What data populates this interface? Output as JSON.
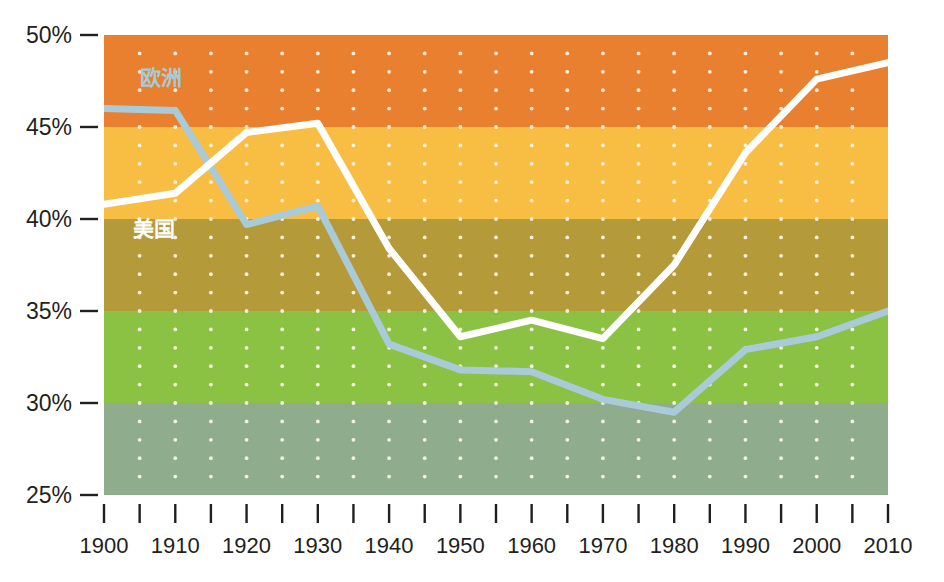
{
  "chart_data": {
    "type": "line",
    "title": "",
    "subtitle": "",
    "xlabel": "",
    "ylabel": "",
    "xlim": [
      1900,
      2010
    ],
    "ylim": [
      25,
      50
    ],
    "x_ticks": [
      1900,
      1910,
      1920,
      1930,
      1940,
      1950,
      1960,
      1970,
      1980,
      1990,
      2000,
      2010
    ],
    "x_minor_ticks": [
      1900,
      1905,
      1910,
      1915,
      1920,
      1925,
      1930,
      1935,
      1940,
      1945,
      1950,
      1955,
      1960,
      1965,
      1970,
      1975,
      1980,
      1985,
      1990,
      1995,
      2000,
      2005,
      2010
    ],
    "y_ticks": [
      25,
      30,
      35,
      40,
      45,
      50
    ],
    "y_tick_labels": [
      "25%",
      "30%",
      "35%",
      "40%",
      "45%",
      "50%"
    ],
    "grid": "dotted-white-dots",
    "legend": "inline-labels",
    "series": [
      {
        "name": "欧洲",
        "color": "#a9cad8",
        "label_color": "#a9cad8",
        "x": [
          1900,
          1910,
          1920,
          1930,
          1940,
          1950,
          1960,
          1970,
          1980,
          1990,
          2000,
          2010
        ],
        "values": [
          46.0,
          45.9,
          39.7,
          40.7,
          33.2,
          31.8,
          31.7,
          30.2,
          29.5,
          32.9,
          33.6,
          35.0
        ]
      },
      {
        "name": "美国",
        "color": "#ffffff",
        "label_color": "#ffffff",
        "x": [
          1900,
          1910,
          1920,
          1930,
          1940,
          1950,
          1960,
          1970,
          1980,
          1990,
          2000,
          2010
        ],
        "values": [
          40.8,
          41.4,
          44.7,
          45.2,
          38.4,
          33.6,
          34.5,
          33.5,
          37.5,
          43.6,
          47.6,
          48.5
        ]
      }
    ],
    "bands": [
      {
        "name": "band-orange",
        "from": 45,
        "to": 50,
        "color": "#e8802f"
      },
      {
        "name": "band-amber",
        "from": 40,
        "to": 45,
        "color": "#f8bd43"
      },
      {
        "name": "band-olive",
        "from": 35,
        "to": 40,
        "color": "#b49a38"
      },
      {
        "name": "band-green",
        "from": 30,
        "to": 35,
        "color": "#8cc243"
      },
      {
        "name": "band-sage",
        "from": 25,
        "to": 30,
        "color": "#8fad8c"
      }
    ],
    "annotations": [
      {
        "name": "europe-label",
        "text": "欧洲",
        "x": 1905,
        "y": 47.3,
        "color": "#a9cad8"
      },
      {
        "name": "usa-label",
        "text": "美国",
        "x": 1904,
        "y": 39.1,
        "color": "#ffffff"
      }
    ]
  },
  "axes": {
    "y_labels": [
      "50%",
      "45%",
      "40%",
      "35%",
      "30%",
      "25%"
    ],
    "x_labels": [
      "1900",
      "1910",
      "1920",
      "1930",
      "1940",
      "1950",
      "1960",
      "1970",
      "1980",
      "1990",
      "2000",
      "2010"
    ]
  },
  "colors": {
    "band_orange": "#e8802f",
    "band_amber": "#f8bd43",
    "band_olive": "#b49a38",
    "band_green": "#8cc243",
    "band_sage": "#8fad8c",
    "europe_line": "#a9cad8",
    "usa_line": "#ffffff",
    "text": "#231f20",
    "grid_dot": "#fdf6ea",
    "background": "#ffffff"
  }
}
